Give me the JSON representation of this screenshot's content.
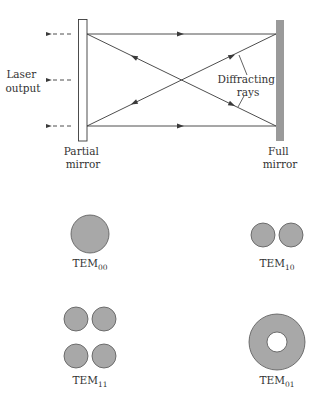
{
  "diagram": {
    "labels": {
      "laser_output_line1": "Laser",
      "laser_output_line2": "output",
      "diffracting_line1": "Diffracting",
      "diffracting_line2": "rays",
      "partial_mirror_line1": "Partial",
      "partial_mirror_line2": "mirror",
      "full_mirror_line1": "Full",
      "full_mirror_line2": "mirror"
    },
    "modes": [
      {
        "base": "TEM",
        "sub": "00"
      },
      {
        "base": "TEM",
        "sub": "10"
      },
      {
        "base": "TEM",
        "sub": "11"
      },
      {
        "base": "TEM",
        "sub": "01"
      }
    ],
    "colors": {
      "line": "#3a3a3a",
      "mode_fill": "#a8a8a8",
      "full_mirror_fill": "#9a9a9a",
      "partial_mirror_fill": "#ffffff"
    }
  }
}
